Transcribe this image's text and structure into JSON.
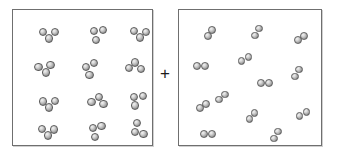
{
  "figure": {
    "operator": "+",
    "background_color": "#ffffff",
    "atom_color": "#a9a9a9",
    "border_color": "#6f6f6f"
  },
  "boxes": [
    {
      "id": "box-left",
      "name": "left-reactant-box",
      "label": "Left container",
      "molecule_type": "triatomic",
      "atoms_per_molecule": 3,
      "molecule_count": 12,
      "atom_radius": 4.1,
      "rect": {
        "x": 12,
        "y": 9,
        "w": 141,
        "h": 137
      },
      "molecules": [
        {
          "x": 36,
          "y": 25,
          "rot": 0
        },
        {
          "x": 84,
          "y": 23,
          "rot": 125
        },
        {
          "x": 127,
          "y": 24,
          "rot": 5
        },
        {
          "x": 32,
          "y": 59,
          "rot": 350
        },
        {
          "x": 76,
          "y": 58,
          "rot": 110
        },
        {
          "x": 122,
          "y": 56,
          "rot": 185
        },
        {
          "x": 36,
          "y": 94,
          "rot": 358
        },
        {
          "x": 85,
          "y": 90,
          "rot": 190
        },
        {
          "x": 124,
          "y": 89,
          "rot": 130
        },
        {
          "x": 35,
          "y": 122,
          "rot": 2
        },
        {
          "x": 83,
          "y": 120,
          "rot": 120
        },
        {
          "x": 125,
          "y": 120,
          "rot": 60
        }
      ]
    },
    {
      "id": "box-right",
      "name": "right-reactant-box",
      "label": "Right container",
      "molecule_type": "diatomic",
      "atoms_per_molecule": 2,
      "molecule_count": 13,
      "atom_radius": 3.9,
      "rect": {
        "x": 178,
        "y": 9,
        "w": 144,
        "h": 137
      },
      "molecules": [
        {
          "x": 31,
          "y": 23,
          "rot": 125
        },
        {
          "x": 78,
          "y": 22,
          "rot": 120
        },
        {
          "x": 122,
          "y": 28,
          "rot": 145
        },
        {
          "x": 22,
          "y": 56,
          "rot": 182
        },
        {
          "x": 66,
          "y": 49,
          "rot": 148
        },
        {
          "x": 118,
          "y": 63,
          "rot": 120
        },
        {
          "x": 86,
          "y": 73,
          "rot": 178
        },
        {
          "x": 24,
          "y": 96,
          "rot": 145
        },
        {
          "x": 73,
          "y": 106,
          "rot": 128
        },
        {
          "x": 124,
          "y": 104,
          "rot": 148
        },
        {
          "x": 29,
          "y": 124,
          "rot": 180
        },
        {
          "x": 97,
          "y": 125,
          "rot": 122
        },
        {
          "x": 43,
          "y": 87,
          "rot": 143
        }
      ]
    }
  ]
}
